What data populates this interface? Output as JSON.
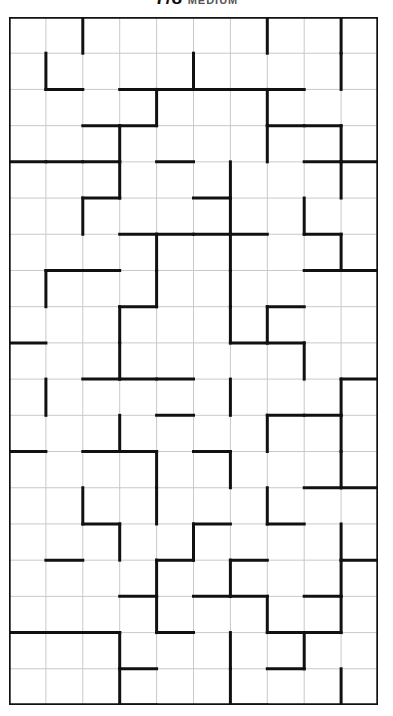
{
  "header": {
    "puzzle_name": "7/8",
    "difficulty": "MEDIUM",
    "clipped": "true"
  },
  "footer": {
    "mark": ""
  },
  "grid": {
    "columns": 10,
    "rows": 19,
    "cell_size_px": 36.9,
    "origin_x_px": 9,
    "origin_y_px": 17,
    "thin_line_color": "#c9c9c9",
    "thick_line_color": "#111111",
    "cell_values": [],
    "description": "Region-division puzzle grid: 10 columns by 19 rows of empty square cells, thin grey cell separators, thick black lines marking region (pentomino-like) boundaries."
  },
  "chart_data": {
    "type": "table",
    "columns": 10,
    "rows": 19,
    "grid": true,
    "xlabel": "",
    "ylabel": "",
    "h_walls": [
      "0000000000",
      "0101111100",
      "0011000110",
      "1110100011",
      "0010010000",
      "0001111010",
      "0110000011",
      "0001000100",
      "1000001100",
      "0011100001",
      "0000100110",
      "1011010000",
      "0000000011",
      "0010010100",
      "0100101001",
      "0001011010",
      "1110100110",
      "0001000100",
      "0001001000"
    ],
    "v_walls": [
      "10100001011",
      "11000100011",
      "10001001001",
      "10010001011",
      "10010010011",
      "10100010101",
      "10001010011",
      "11001010001",
      "10010011001",
      "10010000101",
      "11000010011",
      "10010001011",
      "10001010011",
      "10101001001",
      "10010100011",
      "10001010011",
      "10001001011",
      "10010010101",
      "10010010011"
    ],
    "annotations": [
      "Title text is cut off at the top edge of the screenshot",
      "All cells are empty (no digits printed)"
    ]
  }
}
